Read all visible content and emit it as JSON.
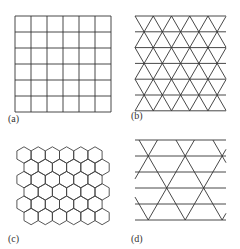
{
  "panels": [
    {
      "label": "(a)",
      "lattice": "square",
      "rows": 6,
      "cols": 6
    },
    {
      "label": "(b)",
      "lattice": "triangular",
      "horizontal_lines": 7
    },
    {
      "label": "(c)",
      "lattice": "hexagonal (honeycomb)",
      "rows": 6
    },
    {
      "label": "(d)",
      "lattice": "kagome"
    }
  ],
  "line_color": "#333333"
}
